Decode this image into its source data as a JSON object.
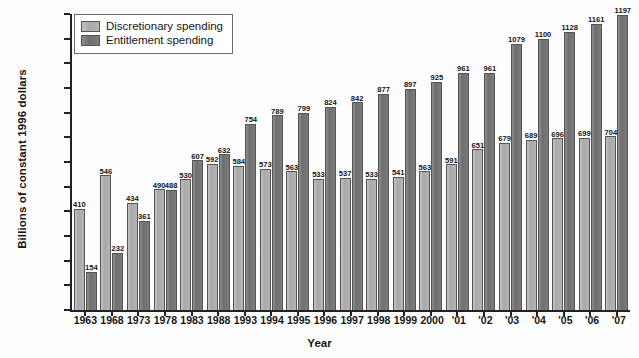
{
  "chart_data": {
    "type": "bar",
    "title": "",
    "xlabel": "Year",
    "ylabel": "Billions of constant 1996 dollars",
    "ylim": [
      0,
      1200
    ],
    "ytick_step": 100,
    "grid": false,
    "legend_position": "top-left",
    "categories": [
      "1963",
      "1968",
      "1973",
      "1978",
      "1983",
      "1988",
      "1993",
      "1994",
      "1995",
      "1996",
      "1997",
      "1998",
      "1999",
      "2000",
      "'01",
      "'02",
      "'03",
      "'04",
      "'05",
      "'06",
      "'07"
    ],
    "yticks": [
      "1200",
      "1100",
      "1000",
      "900",
      "800",
      "700",
      "600",
      "500",
      "400",
      "300",
      "200",
      "100",
      "0"
    ],
    "series": [
      {
        "name": "Discretionary spending",
        "color": "#adadad",
        "values": [
          410,
          546,
          434,
          490,
          530,
          592,
          584,
          573,
          563,
          533,
          537,
          533,
          541,
          563,
          591,
          651,
          679,
          689,
          696,
          699,
          704
        ]
      },
      {
        "name": "Entitlement spending",
        "color": "#7a7a7a",
        "values": [
          154,
          232,
          361,
          488,
          607,
          632,
          754,
          789,
          799,
          824,
          842,
          877,
          897,
          925,
          961,
          961,
          1079,
          1100,
          1128,
          1161,
          1197
        ]
      }
    ]
  },
  "legend": {
    "items": [
      {
        "label": "Discretionary spending",
        "key": "disc"
      },
      {
        "label": "Entitlement spending",
        "key": "ent"
      }
    ]
  }
}
